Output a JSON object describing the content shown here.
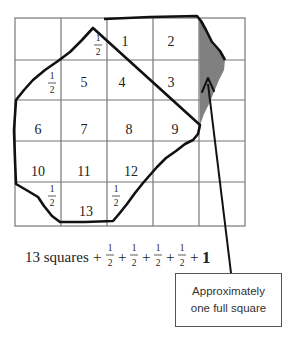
{
  "diagram": {
    "grid": {
      "cols": 5,
      "rows": 5,
      "line_color": "#777777"
    },
    "cells": [
      {
        "label": "1",
        "row": 0,
        "col": 2
      },
      {
        "label": "2",
        "row": 0,
        "col": 3
      },
      {
        "label": "3",
        "row": 1,
        "col": 3
      },
      {
        "label": "4",
        "row": 1,
        "col": 2
      },
      {
        "label": "5",
        "row": 1,
        "col": 1
      },
      {
        "label": "6",
        "row": 2,
        "col": 0
      },
      {
        "label": "7",
        "row": 2,
        "col": 1
      },
      {
        "label": "8",
        "row": 2,
        "col": 2
      },
      {
        "label": "9",
        "row": 2,
        "col": 3
      },
      {
        "label": "10",
        "row": 3,
        "col": 0
      },
      {
        "label": "11",
        "row": 3,
        "col": 1
      },
      {
        "label": "12",
        "row": 3,
        "col": 2
      },
      {
        "label": "13",
        "row": 4,
        "col": 1
      }
    ],
    "half_cells": [
      {
        "numerator": "1",
        "denominator": "2",
        "row": 0,
        "col": 1
      },
      {
        "numerator": "1",
        "denominator": "2",
        "row": 1,
        "col": 0
      },
      {
        "numerator": "1",
        "denominator": "2",
        "row": 4,
        "col": 0
      },
      {
        "numerator": "1",
        "denominator": "2",
        "row": 4,
        "col": 2
      }
    ],
    "shaded_region_color": "#808080",
    "outline_color": "#111111"
  },
  "formula": {
    "lead": "13 squares",
    "plus": "+",
    "fractions": [
      {
        "numerator": "1",
        "denominator": "2"
      },
      {
        "numerator": "1",
        "denominator": "2"
      },
      {
        "numerator": "1",
        "denominator": "2"
      },
      {
        "numerator": "1",
        "denominator": "2"
      }
    ],
    "final_term": "1"
  },
  "callout": {
    "line1": "Approximately",
    "line2": "one full square"
  }
}
